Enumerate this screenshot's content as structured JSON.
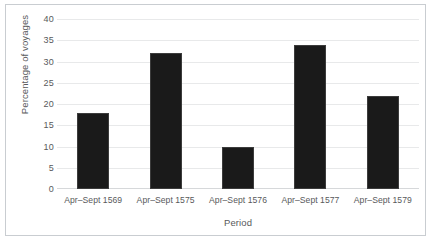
{
  "chart_data": {
    "type": "bar",
    "title": "",
    "subtitle": "",
    "xlabel": "Period",
    "ylabel": "Percentage of voyages",
    "categories": [
      "Apr–Sept 1569",
      "Apr–Sept 1575",
      "Apr–Sept 1576",
      "Apr–Sept 1577",
      "Apr–Sept 1579"
    ],
    "values": [
      18,
      32,
      10,
      34,
      22
    ],
    "ylim": [
      0,
      40
    ],
    "ytick_values": [
      0,
      5,
      10,
      15,
      20,
      25,
      30,
      35,
      40
    ],
    "ytick_labels": [
      "0",
      "5",
      "10",
      "15",
      "20",
      "25",
      "30",
      "35",
      "40"
    ],
    "grid": true,
    "legend": false,
    "legend_position": "none",
    "bar_color": "#1a1a1a",
    "gridline_color": "#e8e9ea",
    "axis_text_color": "#58595b",
    "border_color": "#c9cdd1",
    "background_color": "#ffffff"
  }
}
